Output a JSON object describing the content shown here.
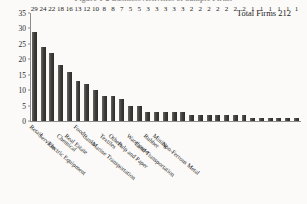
{
  "figure": {
    "title": "Figure 1-2  Business Activities of Sample Firms",
    "annotation": "Total Firms 212"
  },
  "chart_data": {
    "type": "bar",
    "title": "Figure 1-2  Business Activities of Sample Firms",
    "annotation": "Total Firms 212",
    "xlabel": "",
    "ylabel": "",
    "ylim": [
      0,
      35
    ],
    "yticks": [
      0,
      5,
      10,
      15,
      20,
      25,
      30,
      35
    ],
    "grid": false,
    "legend": "none",
    "bar_color": "#413f3c",
    "categories": [
      "Retail",
      "Services",
      "Electric Equipment",
      "Chemical",
      "Real Estate",
      "Food",
      "Banks",
      "Marine Transportation",
      "Textiles",
      "Others",
      "Pulp and Paper",
      "Warehouse",
      "Land Transportation",
      "Rubber",
      "Mining",
      "Non-Ferrous Metal"
    ],
    "values": [
      29,
      24,
      22,
      18,
      16,
      13,
      12,
      10,
      8,
      8,
      7,
      5,
      5,
      3,
      3,
      3
    ],
    "bars": [
      {
        "label": "Retail",
        "value": 29,
        "named": true
      },
      {
        "label": "Services",
        "value": 24,
        "named": true
      },
      {
        "label": "Electric Equipment",
        "value": 22,
        "named": true
      },
      {
        "label": "Chemical",
        "value": 18,
        "named": true
      },
      {
        "label": "Real Estate",
        "value": 16,
        "named": true
      },
      {
        "label": "Food",
        "value": 13,
        "named": true
      },
      {
        "label": "Banks",
        "value": 12,
        "named": true
      },
      {
        "label": "Marine Transportation",
        "value": 10,
        "named": true
      },
      {
        "label": "Textiles",
        "value": 8,
        "named": true
      },
      {
        "label": "Others",
        "value": 8,
        "named": true
      },
      {
        "label": "Pulp and Paper",
        "value": 7,
        "named": true
      },
      {
        "label": "Warehouse",
        "value": 5,
        "named": true
      },
      {
        "label": "Land Transportation",
        "value": 5,
        "named": true
      },
      {
        "label": "Rubber",
        "value": 3,
        "named": true
      },
      {
        "label": "Mining",
        "value": 3,
        "named": true
      },
      {
        "label": "Non-Ferrous Metal",
        "value": 3,
        "named": true
      },
      {
        "label": "",
        "value": 3,
        "named": false
      },
      {
        "label": "",
        "value": 3,
        "named": false
      },
      {
        "label": "",
        "value": 2,
        "named": false
      },
      {
        "label": "",
        "value": 2,
        "named": false
      },
      {
        "label": "",
        "value": 2,
        "named": false
      },
      {
        "label": "",
        "value": 2,
        "named": false
      },
      {
        "label": "",
        "value": 2,
        "named": false
      },
      {
        "label": "",
        "value": 2,
        "named": false
      },
      {
        "label": "",
        "value": 2,
        "named": false
      },
      {
        "label": "",
        "value": 1,
        "named": false
      },
      {
        "label": "",
        "value": 1,
        "named": false
      },
      {
        "label": "",
        "value": 1,
        "named": false
      },
      {
        "label": "",
        "value": 1,
        "named": false
      },
      {
        "label": "",
        "value": 1,
        "named": false
      },
      {
        "label": "",
        "value": 1,
        "named": false
      }
    ],
    "category_label_positions": [
      {
        "label": "Retail",
        "row": 0
      },
      {
        "label": "Services",
        "row": 1
      },
      {
        "label": "Electric Equipment",
        "row": 2
      },
      {
        "label": "Chemical",
        "row": 1
      },
      {
        "label": "Real Estate",
        "row": 1
      },
      {
        "label": "Food",
        "row": 0
      },
      {
        "label": "Banks",
        "row": 1
      },
      {
        "label": "Marine Transportation",
        "row": 2
      },
      {
        "label": "Textiles",
        "row": 1
      },
      {
        "label": "Others",
        "row": 1
      },
      {
        "label": "Pulp and Paper",
        "row": 2
      },
      {
        "label": "Warehouse",
        "row": 1
      },
      {
        "label": "Land Transportation",
        "row": 2
      },
      {
        "label": "Rubber",
        "row": 1
      },
      {
        "label": "Mining",
        "row": 1
      },
      {
        "label": "Non-Ferrous Metal",
        "row": 2
      }
    ]
  }
}
